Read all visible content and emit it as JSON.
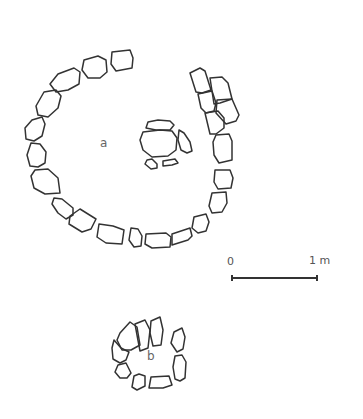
{
  "figure": {
    "type": "archaeological site plan",
    "labels": {
      "structure_a": "a",
      "structure_b": "b"
    },
    "scale_bar": {
      "start_label": "0",
      "end_label": "1 m"
    },
    "colors": {
      "ink": "#333333",
      "label": "#666666",
      "background": "#ffffff"
    }
  }
}
